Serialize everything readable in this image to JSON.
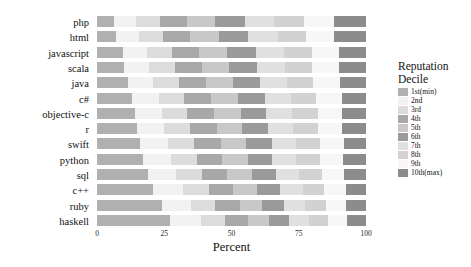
{
  "chart_data": {
    "type": "bar",
    "orientation": "horizontal",
    "stacked": true,
    "stack_mode": "percent",
    "title": "",
    "xlabel": "Percent",
    "ylabel": "",
    "xlim": [
      0,
      100
    ],
    "xticks": [
      0,
      25,
      50,
      75,
      100
    ],
    "xtick_labels": [
      "0",
      "25",
      "50",
      "75",
      "100"
    ],
    "grid": false,
    "legend_position": "right",
    "legend_title_line1": "Reputation",
    "legend_title_line2": "Decile",
    "categories": [
      "php",
      "html",
      "javascript",
      "scala",
      "java",
      "c#",
      "objective-c",
      "r",
      "swift",
      "python",
      "sql",
      "c++",
      "ruby",
      "haskell"
    ],
    "series": [
      {
        "name": "1st(min)",
        "color": "#b0b0b0",
        "values": [
          6.5,
          7.2,
          9.5,
          10.0,
          11.5,
          13.0,
          14.0,
          15.0,
          16.0,
          17.0,
          19.0,
          21.0,
          24.0,
          27.0
        ]
      },
      {
        "name": "2nd",
        "color": "#f2f2f2",
        "values": [
          8.0,
          8.5,
          9.0,
          9.5,
          9.5,
          10.0,
          10.0,
          10.0,
          10.5,
          10.5,
          10.5,
          11.0,
          11.0,
          11.5
        ]
      },
      {
        "name": "3rd",
        "color": "#dcdcdc",
        "values": [
          9.0,
          9.0,
          9.5,
          9.5,
          9.5,
          9.5,
          9.5,
          9.5,
          9.5,
          9.5,
          9.5,
          9.5,
          9.0,
          9.0
        ]
      },
      {
        "name": "4th",
        "color": "#a8a8a8",
        "values": [
          10.0,
          10.0,
          10.0,
          10.0,
          10.0,
          10.0,
          10.0,
          10.0,
          10.0,
          9.5,
          9.5,
          9.0,
          9.0,
          8.5
        ]
      },
      {
        "name": "5th",
        "color": "#c8c8c8",
        "values": [
          10.5,
          10.5,
          10.5,
          10.0,
          10.0,
          10.0,
          10.0,
          9.5,
          9.5,
          9.5,
          9.0,
          9.0,
          8.5,
          8.0
        ]
      },
      {
        "name": "6th",
        "color": "#9a9a9a",
        "values": [
          11.0,
          11.0,
          10.5,
          10.5,
          10.0,
          10.0,
          9.5,
          9.5,
          9.5,
          9.0,
          9.0,
          8.5,
          8.0,
          7.5
        ]
      },
      {
        "name": "7th",
        "color": "#e0e0e0",
        "values": [
          11.0,
          11.0,
          10.5,
          10.5,
          10.0,
          9.5,
          9.5,
          9.5,
          9.0,
          9.0,
          8.5,
          8.5,
          8.0,
          7.5
        ]
      },
      {
        "name": "8th",
        "color": "#d2d2d2",
        "values": [
          11.0,
          10.5,
          10.5,
          10.0,
          10.0,
          9.5,
          9.5,
          9.0,
          9.0,
          9.0,
          8.5,
          8.0,
          7.5,
          7.0
        ]
      },
      {
        "name": "9th",
        "color": "#f7f7f7",
        "values": [
          11.0,
          10.5,
          10.0,
          10.0,
          10.0,
          9.5,
          9.0,
          9.0,
          9.0,
          8.5,
          8.5,
          8.0,
          7.5,
          7.0
        ]
      },
      {
        "name": "10th(max)",
        "color": "#8c8c8c",
        "values": [
          12.0,
          11.8,
          10.0,
          10.0,
          9.5,
          9.0,
          9.0,
          9.0,
          8.0,
          8.5,
          8.0,
          7.5,
          7.5,
          7.0
        ]
      }
    ]
  }
}
